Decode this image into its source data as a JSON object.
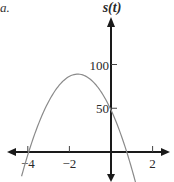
{
  "corner_label": "a.",
  "chart_data": {
    "type": "line",
    "title": "",
    "xlabel": "",
    "ylabel": "s(t)",
    "function": "s(t) ≈ -16(t + 1.6)^2 + 89",
    "x_ticks": [
      -4,
      -2,
      2
    ],
    "x_tick_labels": [
      "−4",
      "−2",
      "2"
    ],
    "y_ticks": [
      50,
      100
    ],
    "y_tick_labels": [
      "50",
      "100"
    ],
    "xlim": [
      -5.3,
      3.0
    ],
    "ylim": [
      -30,
      160
    ],
    "grid": false,
    "legend": null,
    "series": [
      {
        "name": "s(t)",
        "color": "#8a8a8a",
        "x": [
          -4.3,
          -4.0,
          -3.5,
          -3.0,
          -2.5,
          -2.0,
          -1.6,
          -1.0,
          -0.5,
          0.0,
          0.5,
          1.0,
          1.3
        ],
        "values": [
          -27.6,
          -3.2,
          31.2,
          57.6,
          76.0,
          86.4,
          89.0,
          83.2,
          71.2,
          48.0,
          17.4,
          -11.2,
          -49.0
        ]
      }
    ],
    "vertex": {
      "t": -1.6,
      "s": 89
    },
    "y_intercept": 48,
    "roots": [
      -3.96,
      0.76
    ]
  }
}
